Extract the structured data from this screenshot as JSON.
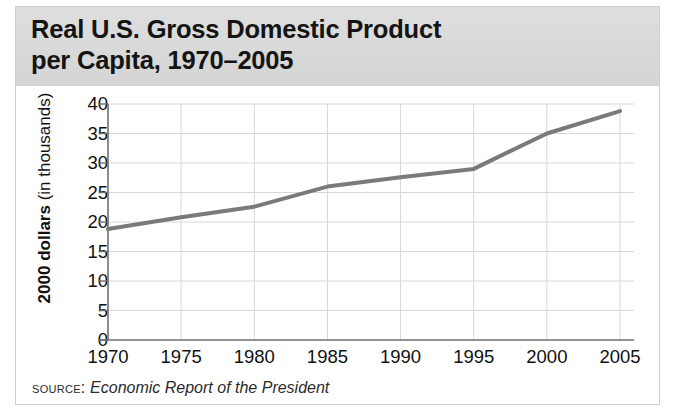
{
  "figure": {
    "title": "Real U.S. Gross Domestic Product\nper Capita, 1970–2005",
    "source_label": "Source:",
    "source_text": "Economic Report of the President",
    "background_color": "#ffffff",
    "banner_color": "#dcdcdc",
    "line_color": "#7a7a7a",
    "grid_color": "#d8d8d8",
    "axis_color": "#6e6e6e",
    "text_color": "#111111"
  },
  "y_axis": {
    "label_bold": "2000 dollars",
    "label_plain": " (in thousands)"
  },
  "chart_data": {
    "type": "line",
    "title": "Real U.S. Gross Domestic Product per Capita, 1970–2005",
    "xlabel": "",
    "ylabel": "2000 dollars (in thousands)",
    "x": [
      1970,
      1975,
      1980,
      1985,
      1990,
      1995,
      2000,
      2005
    ],
    "values": [
      18.8,
      20.8,
      22.6,
      26.0,
      27.6,
      29.0,
      35.0,
      38.8
    ],
    "series": [
      {
        "name": "Real GDP per capita",
        "values": [
          18.8,
          20.8,
          22.6,
          26.0,
          27.6,
          29.0,
          35.0,
          38.8
        ]
      }
    ],
    "x_tick_labels": [
      "1970",
      "1975",
      "1980",
      "1985",
      "1990",
      "1995",
      "2000",
      "2005"
    ],
    "y_tick_labels": [
      "0",
      "5",
      "10",
      "15",
      "20",
      "25",
      "30",
      "35",
      "40"
    ],
    "y_ticks": [
      0,
      5,
      10,
      15,
      20,
      25,
      30,
      35,
      40
    ],
    "xlim": [
      1970,
      2005
    ],
    "ylim": [
      0,
      40
    ],
    "grid": true,
    "legend": "none"
  }
}
